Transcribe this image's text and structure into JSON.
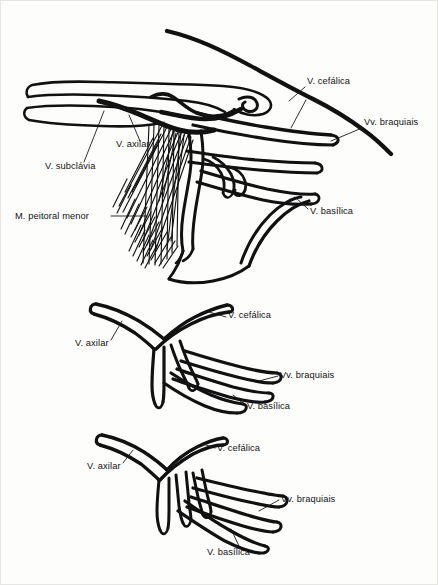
{
  "figure": {
    "background_color": "#fdfdfc",
    "ink_color": "#111111",
    "panels": [
      {
        "id": "panel-top",
        "name": "axillary-region-with-pectoralis-minor",
        "labels": [
          {
            "id": "lbl-cefalica-top",
            "text": "V. cefálica",
            "x": 306,
            "y": 83,
            "align": "start"
          },
          {
            "id": "lbl-braquiais-top",
            "text": "Vv. braquiais",
            "x": 363,
            "y": 124,
            "align": "start"
          },
          {
            "id": "lbl-axilar-top",
            "text": "V. axilar",
            "x": 115,
            "y": 146,
            "align": "start"
          },
          {
            "id": "lbl-subclavia-top",
            "text": "V. subclávia",
            "x": 44,
            "y": 168,
            "align": "start"
          },
          {
            "id": "lbl-basilica-top",
            "text": "V. basílica",
            "x": 309,
            "y": 213,
            "align": "start"
          },
          {
            "id": "lbl-peitoral-top",
            "text": "M. peitoral menor",
            "x": 14,
            "y": 218,
            "align": "start"
          }
        ],
        "structures": [
          "veia subclávia",
          "veia axilar",
          "veia cefálica",
          "veias braquiais",
          "veia basílica",
          "músculo peitoral menor"
        ]
      },
      {
        "id": "panel-middle",
        "name": "venous-variation-pattern-2",
        "labels": [
          {
            "id": "lbl-cefalica-mid",
            "text": "V. cefálica",
            "x": 227,
            "y": 317,
            "align": "start"
          },
          {
            "id": "lbl-axilar-mid",
            "text": "V. axilar",
            "x": 74,
            "y": 345,
            "align": "start"
          },
          {
            "id": "lbl-braquiais-mid",
            "text": "Vv. braquiais",
            "x": 279,
            "y": 377,
            "align": "start"
          },
          {
            "id": "lbl-basilica-mid",
            "text": "V. basílica",
            "x": 246,
            "y": 408,
            "align": "start"
          }
        ],
        "structures": [
          "veia axilar",
          "veia cefálica",
          "veias braquiais",
          "veia basílica"
        ]
      },
      {
        "id": "panel-bottom",
        "name": "venous-variation-pattern-3",
        "labels": [
          {
            "id": "lbl-cefalica-bot",
            "text": "V. cefálica",
            "x": 216,
            "y": 450,
            "align": "start"
          },
          {
            "id": "lbl-axilar-bot",
            "text": "V. axilar",
            "x": 86,
            "y": 468,
            "align": "start"
          },
          {
            "id": "lbl-braquiais-bot",
            "text": "Vv. braquiais",
            "x": 280,
            "y": 501,
            "align": "start"
          },
          {
            "id": "lbl-basilica-bot",
            "text": "V. basílica",
            "x": 206,
            "y": 554,
            "align": "start"
          }
        ],
        "structures": [
          "veia axilar",
          "veia cefálica",
          "veias braquiais",
          "veia basílica"
        ]
      }
    ]
  }
}
